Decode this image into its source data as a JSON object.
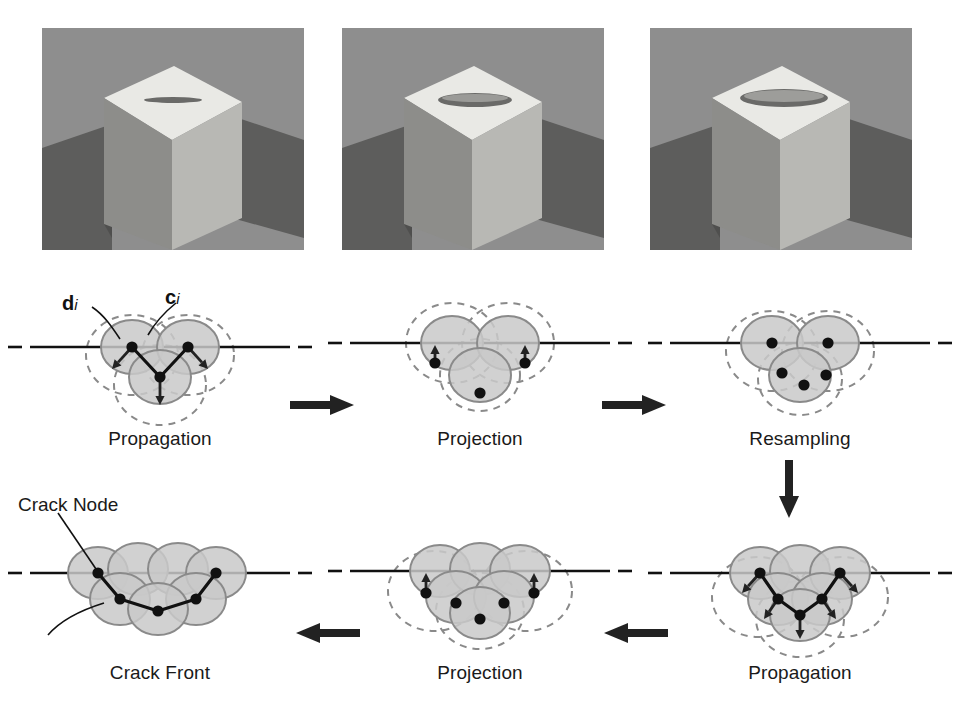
{
  "figure": {
    "background": "#ffffff",
    "renders": [
      {
        "name": "cube-initial",
        "crack_width": 3,
        "crack_length": 58,
        "caption": ""
      },
      {
        "name": "cube-intermediate",
        "crack_width": 9,
        "crack_length": 74,
        "caption": ""
      },
      {
        "name": "cube-final",
        "crack_width": 12,
        "crack_length": 86,
        "caption": ""
      }
    ],
    "render_colors": {
      "background": "#8e8e8e",
      "top_face": "#e8e8e4",
      "front_face": "#b7b7b3",
      "side_face": "#6f6f6d",
      "shadow": "#5d5d5c",
      "crack": "#6a6a68"
    },
    "stage_colors": {
      "disk_fill": "#c9c9c9",
      "disk_stroke": "#8a8a8a",
      "dashed_stroke": "#8a8a8a",
      "node": "#111111",
      "crack_line": "#111111",
      "arrow": "#222222"
    },
    "stages": [
      {
        "id": "stage-1",
        "caption": "Propagation",
        "row": "top",
        "col": 0,
        "disks": [
          {
            "cx": 132,
            "cy": 62,
            "rx": 31,
            "ry": 27
          },
          {
            "cx": 188,
            "cy": 62,
            "rx": 31,
            "ry": 27
          },
          {
            "cx": 160,
            "cy": 92,
            "rx": 31,
            "ry": 27
          }
        ],
        "dashed": [
          {
            "cx": 132,
            "cy": 70,
            "rx": 46,
            "ry": 40
          },
          {
            "cx": 188,
            "cy": 70,
            "rx": 46,
            "ry": 40
          },
          {
            "cx": 160,
            "cy": 100,
            "rx": 46,
            "ry": 40
          }
        ],
        "nodes": [
          {
            "x": 132,
            "y": 62
          },
          {
            "x": 188,
            "y": 62
          },
          {
            "x": 160,
            "y": 92
          }
        ],
        "front_line": [
          [
            132,
            62
          ],
          [
            160,
            92
          ],
          [
            188,
            62
          ]
        ],
        "arrows": [
          {
            "x1": 132,
            "y1": 62,
            "x2": 112,
            "y2": 84
          },
          {
            "x1": 188,
            "y1": 62,
            "x2": 208,
            "y2": 84
          },
          {
            "x1": 160,
            "y1": 92,
            "x2": 160,
            "y2": 120
          }
        ],
        "crack_plane_y": 62,
        "has_labels": true
      },
      {
        "id": "stage-2",
        "caption": "Projection",
        "row": "top",
        "col": 1,
        "disks": [
          {
            "cx": 132,
            "cy": 58,
            "rx": 31,
            "ry": 27
          },
          {
            "cx": 188,
            "cy": 58,
            "rx": 31,
            "ry": 27
          },
          {
            "cx": 160,
            "cy": 90,
            "rx": 31,
            "ry": 27
          }
        ],
        "dashed": [
          {
            "cx": 132,
            "cy": 58,
            "rx": 46,
            "ry": 40
          },
          {
            "cx": 188,
            "cy": 58,
            "rx": 46,
            "ry": 40
          },
          {
            "cx": 160,
            "cy": 90,
            "rx": 40,
            "ry": 36
          }
        ],
        "nodes": [
          {
            "x": 115,
            "y": 78
          },
          {
            "x": 205,
            "y": 78
          },
          {
            "x": 160,
            "y": 108
          }
        ],
        "front_line": [],
        "arrows": [
          {
            "x1": 115,
            "y1": 82,
            "x2": 115,
            "y2": 60
          },
          {
            "x1": 205,
            "y1": 82,
            "x2": 205,
            "y2": 60
          }
        ],
        "crack_plane_y": 58,
        "has_labels": false
      },
      {
        "id": "stage-3",
        "caption": "Resampling",
        "row": "top",
        "col": 2,
        "disks": [
          {
            "cx": 132,
            "cy": 58,
            "rx": 31,
            "ry": 27
          },
          {
            "cx": 188,
            "cy": 58,
            "rx": 31,
            "ry": 27
          },
          {
            "cx": 160,
            "cy": 90,
            "rx": 31,
            "ry": 27
          }
        ],
        "dashed": [
          {
            "cx": 132,
            "cy": 66,
            "rx": 46,
            "ry": 40
          },
          {
            "cx": 188,
            "cy": 66,
            "rx": 46,
            "ry": 40
          },
          {
            "cx": 160,
            "cy": 94,
            "rx": 42,
            "ry": 36
          }
        ],
        "nodes": [
          {
            "x": 132,
            "y": 58
          },
          {
            "x": 188,
            "y": 58
          },
          {
            "x": 142,
            "y": 88
          },
          {
            "x": 186,
            "y": 90
          },
          {
            "x": 164,
            "y": 100
          }
        ],
        "front_line": [],
        "arrows": [],
        "crack_plane_y": 58,
        "has_labels": false
      },
      {
        "id": "stage-4",
        "caption": "Propagation",
        "row": "bottom",
        "col": 2,
        "disks": [
          {
            "cx": 120,
            "cy": 58,
            "rx": 30,
            "ry": 26
          },
          {
            "cx": 160,
            "cy": 56,
            "rx": 30,
            "ry": 26
          },
          {
            "cx": 200,
            "cy": 58,
            "rx": 30,
            "ry": 26
          },
          {
            "cx": 138,
            "cy": 84,
            "rx": 30,
            "ry": 26
          },
          {
            "cx": 182,
            "cy": 84,
            "rx": 30,
            "ry": 26
          },
          {
            "cx": 160,
            "cy": 100,
            "rx": 30,
            "ry": 26
          }
        ],
        "dashed": [
          {
            "cx": 118,
            "cy": 82,
            "rx": 46,
            "ry": 40
          },
          {
            "cx": 202,
            "cy": 82,
            "rx": 46,
            "ry": 40
          },
          {
            "cx": 160,
            "cy": 104,
            "rx": 44,
            "ry": 38
          }
        ],
        "nodes": [
          {
            "x": 120,
            "y": 58
          },
          {
            "x": 200,
            "y": 58
          },
          {
            "x": 138,
            "y": 84
          },
          {
            "x": 182,
            "y": 84
          },
          {
            "x": 160,
            "y": 100
          }
        ],
        "front_line": [
          [
            120,
            58
          ],
          [
            138,
            84
          ],
          [
            160,
            100
          ],
          [
            182,
            84
          ],
          [
            200,
            58
          ]
        ],
        "arrows": [
          {
            "x1": 120,
            "y1": 58,
            "x2": 102,
            "y2": 78
          },
          {
            "x1": 200,
            "y1": 58,
            "x2": 218,
            "y2": 78
          },
          {
            "x1": 138,
            "y1": 84,
            "x2": 124,
            "y2": 104
          },
          {
            "x1": 182,
            "y1": 84,
            "x2": 196,
            "y2": 104
          },
          {
            "x1": 160,
            "y1": 100,
            "x2": 160,
            "y2": 124
          }
        ],
        "crack_plane_y": 58,
        "has_labels": false
      },
      {
        "id": "stage-5",
        "caption": "Projection",
        "row": "bottom",
        "col": 1,
        "disks": [
          {
            "cx": 120,
            "cy": 56,
            "rx": 30,
            "ry": 26
          },
          {
            "cx": 160,
            "cy": 54,
            "rx": 30,
            "ry": 26
          },
          {
            "cx": 200,
            "cy": 56,
            "rx": 30,
            "ry": 26
          },
          {
            "cx": 136,
            "cy": 82,
            "rx": 30,
            "ry": 26
          },
          {
            "cx": 184,
            "cy": 82,
            "rx": 30,
            "ry": 26
          },
          {
            "cx": 160,
            "cy": 98,
            "rx": 30,
            "ry": 26
          }
        ],
        "dashed": [
          {
            "cx": 114,
            "cy": 76,
            "rx": 46,
            "ry": 40
          },
          {
            "cx": 206,
            "cy": 76,
            "rx": 46,
            "ry": 40
          },
          {
            "cx": 160,
            "cy": 96,
            "rx": 44,
            "ry": 38
          }
        ],
        "nodes": [
          {
            "x": 106,
            "y": 78
          },
          {
            "x": 214,
            "y": 78
          },
          {
            "x": 136,
            "y": 88
          },
          {
            "x": 184,
            "y": 88
          },
          {
            "x": 160,
            "y": 104
          }
        ],
        "front_line": [],
        "arrows": [
          {
            "x1": 106,
            "y1": 82,
            "x2": 106,
            "y2": 58
          },
          {
            "x1": 214,
            "y1": 82,
            "x2": 214,
            "y2": 58
          }
        ],
        "crack_plane_y": 56,
        "has_labels": false
      },
      {
        "id": "stage-6",
        "caption": "Crack Front",
        "row": "bottom",
        "col": 0,
        "disks": [
          {
            "cx": 98,
            "cy": 58,
            "rx": 30,
            "ry": 26
          },
          {
            "cx": 138,
            "cy": 54,
            "rx": 30,
            "ry": 26
          },
          {
            "cx": 178,
            "cy": 54,
            "rx": 30,
            "ry": 26
          },
          {
            "cx": 216,
            "cy": 58,
            "rx": 30,
            "ry": 26
          },
          {
            "cx": 120,
            "cy": 84,
            "rx": 30,
            "ry": 26
          },
          {
            "cx": 196,
            "cy": 84,
            "rx": 30,
            "ry": 26
          },
          {
            "cx": 158,
            "cy": 94,
            "rx": 30,
            "ry": 26
          }
        ],
        "dashed": [],
        "nodes": [
          {
            "x": 98,
            "y": 58
          },
          {
            "x": 216,
            "y": 58
          },
          {
            "x": 120,
            "y": 84
          },
          {
            "x": 196,
            "y": 84
          },
          {
            "x": 158,
            "y": 96
          }
        ],
        "front_line": [
          [
            98,
            58
          ],
          [
            120,
            84
          ],
          [
            158,
            96
          ],
          [
            196,
            84
          ],
          [
            216,
            58
          ]
        ],
        "arrows": [],
        "crack_plane_y": 58,
        "has_labels": false
      }
    ],
    "annotations": {
      "d_label": "d",
      "d_sub": "i",
      "c_label": "c",
      "c_sub": "i",
      "crack_node_label": "Crack Node"
    },
    "flow_arrows": [
      {
        "name": "arrow-stage1-to-stage2",
        "direction": "right",
        "x": 288,
        "y": 400
      },
      {
        "name": "arrow-stage2-to-stage3",
        "direction": "right",
        "x": 600,
        "y": 400
      },
      {
        "name": "arrow-stage3-to-stage4",
        "direction": "down",
        "x": 788,
        "y": 462
      },
      {
        "name": "arrow-stage4-to-stage5",
        "direction": "left",
        "x": 600,
        "y": 628
      },
      {
        "name": "arrow-stage5-to-stage6",
        "direction": "left",
        "x": 292,
        "y": 628
      }
    ]
  }
}
